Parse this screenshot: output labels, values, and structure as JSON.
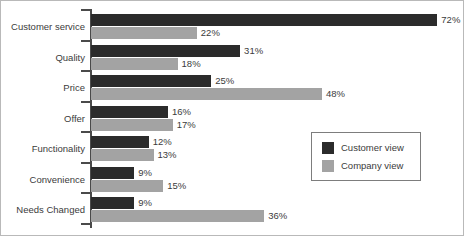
{
  "chart_data": {
    "type": "bar",
    "orientation": "horizontal",
    "title": "",
    "subtitle": "",
    "xlabel": "",
    "ylabel": "",
    "xlim": [
      0,
      72
    ],
    "grid": false,
    "legend_position": "lower-right",
    "value_suffix": "%",
    "categories": [
      "Customer service",
      "Quality",
      "Price",
      "Offer",
      "Functionality",
      "Convenience",
      "Needs Changed"
    ],
    "series": [
      {
        "name": "Customer view",
        "color": "#2b2b2b",
        "values": [
          72,
          31,
          25,
          16,
          12,
          9,
          9
        ],
        "labels": [
          "72%",
          "31%",
          "25%",
          "16%",
          "12%",
          "9%",
          "9%"
        ]
      },
      {
        "name": "Company view",
        "color": "#a3a3a3",
        "values": [
          22,
          18,
          48,
          17,
          13,
          15,
          36
        ],
        "labels": [
          "22%",
          "18%",
          "48%",
          "17%",
          "13%",
          "15%",
          "36%"
        ]
      }
    ]
  },
  "legend": {
    "entries": [
      {
        "label": "Customer view",
        "color": "#2b2b2b"
      },
      {
        "label": "Company view",
        "color": "#a3a3a3"
      }
    ]
  },
  "colors": {
    "customer_view": "#2b2b2b",
    "company_view": "#a3a3a3",
    "axis": "#4a4a4a",
    "text": "#3b3b3b",
    "frame": "#b9b9b9"
  }
}
